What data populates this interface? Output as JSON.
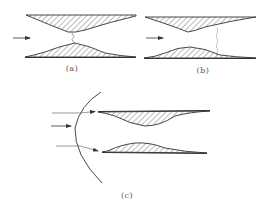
{
  "figure": {
    "panels": [
      {
        "id": "a",
        "label": "(a)",
        "label_pos": [
          72,
          65
        ]
      },
      {
        "id": "b",
        "label": "(b)",
        "label_pos": [
          203,
          67
        ]
      },
      {
        "id": "c",
        "label": "(c)",
        "label_pos": [
          127,
          192
        ]
      }
    ],
    "colors": {
      "stroke": "#333333",
      "hatch": "#555555",
      "wave": "#777777",
      "label": "#555555"
    }
  }
}
